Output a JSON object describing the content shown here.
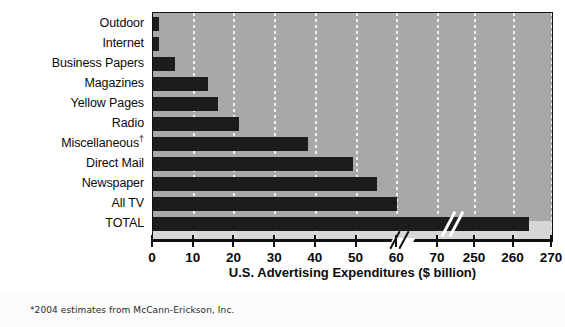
{
  "figure": {
    "xaxis_title": "U.S. Advertising Expenditures ($ billion)",
    "footnote": "*2004 estimates from McCann-Erickson, Inc.",
    "dagger": "†",
    "colors": {
      "plot_background": "#a8a8a8",
      "plot_floor": "#d6d6d6",
      "bar": "#1c1c1c",
      "gridline": "#f0f0f0",
      "frame": "#111111",
      "page_background": "#ffffff"
    }
  },
  "chart_data": {
    "type": "bar",
    "orientation": "horizontal",
    "title": "",
    "xlabel": "U.S. Advertising Expenditures ($ billion)",
    "ylabel": "",
    "categories": [
      "Outdoor",
      "Internet",
      "Business Papers",
      "Magazines",
      "Yellow Pages",
      "Radio",
      "Miscellaneous†",
      "Direct Mail",
      "Newspaper",
      "All TV",
      "TOTAL"
    ],
    "values": [
      1.5,
      1.5,
      5.5,
      13.5,
      16,
      21,
      38,
      49,
      55,
      60,
      264
    ],
    "units": "$ billion",
    "xlim": [
      0,
      270
    ],
    "axis_break": {
      "from": 70,
      "to": 250,
      "present": true
    },
    "tick_labels": [
      "0",
      "10",
      "20",
      "30",
      "40",
      "50",
      "60",
      "70",
      "250",
      "260",
      "270"
    ],
    "tick_values": [
      0,
      10,
      20,
      30,
      40,
      50,
      60,
      70,
      250,
      260,
      270
    ],
    "grid": true,
    "grid_axis": "x",
    "legend": null,
    "annotations": [
      "*2004 estimates from McCann-Erickson, Inc."
    ]
  }
}
